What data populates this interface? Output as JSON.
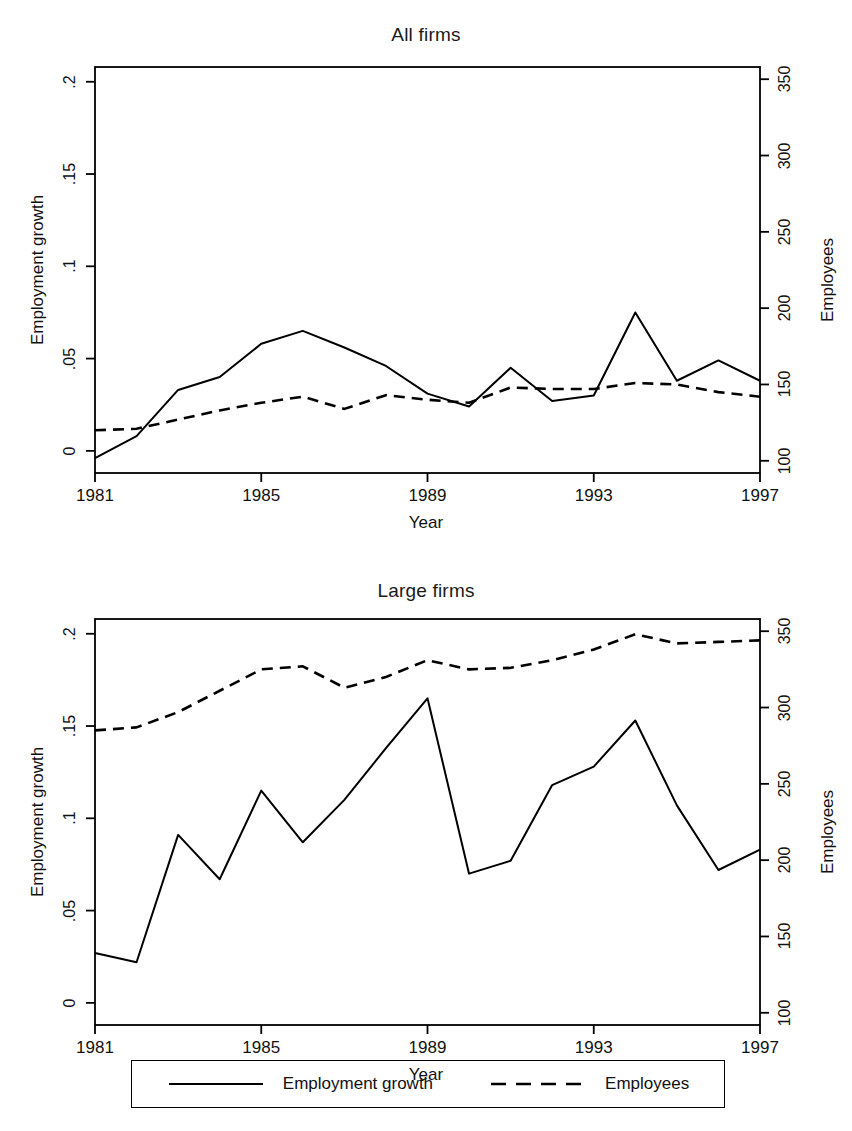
{
  "figure": {
    "background": "#ffffff",
    "ink_color": "#000000"
  },
  "legend": {
    "entries": [
      {
        "label": "Employment growth",
        "style": "solid",
        "swatch": "solid-line-swatch"
      },
      {
        "label": "Employees",
        "style": "dashed",
        "swatch": "dashed-line-swatch"
      }
    ]
  },
  "panels": [
    {
      "id": "all-firms",
      "title": "All firms",
      "xlabel": "Year",
      "ylabel_left": "Employment growth",
      "ylabel_right": "Employees",
      "xticks": [
        "1981",
        "1985",
        "1989",
        "1993",
        "1997"
      ],
      "yticks_left": [
        ".2",
        ".15",
        ".1",
        ".05",
        "0"
      ],
      "yticks_right": [
        "350",
        "300",
        "250",
        "200",
        "150",
        "100"
      ]
    },
    {
      "id": "large-firms",
      "title": "Large firms",
      "xlabel": "Year",
      "ylabel_left": "Employment growth",
      "ylabel_right": "Employees",
      "xticks": [
        "1981",
        "1985",
        "1989",
        "1993",
        "1997"
      ],
      "yticks_left": [
        ".2",
        ".15",
        ".1",
        ".05",
        "0"
      ],
      "yticks_right": [
        "350",
        "300",
        "250",
        "200",
        "150",
        "100"
      ]
    }
  ],
  "chart_data": [
    {
      "type": "line",
      "title": "All firms",
      "xlabel": "Year",
      "ylabel": "Employment growth",
      "ylabel_secondary": "Employees",
      "x": [
        1981,
        1982,
        1983,
        1984,
        1985,
        1986,
        1987,
        1988,
        1989,
        1990,
        1991,
        1992,
        1993,
        1994,
        1995,
        1996,
        1997
      ],
      "xlim": [
        1981,
        1997
      ],
      "ylim": [
        -0.012,
        0.208
      ],
      "ylim_secondary": [
        92,
        358
      ],
      "grid": false,
      "legend_position": "below-figure",
      "series": [
        {
          "name": "Employment growth",
          "style": "solid",
          "axis": "left",
          "values": [
            -0.004,
            0.008,
            0.033,
            0.04,
            0.058,
            0.065,
            0.056,
            0.046,
            0.031,
            0.024,
            0.045,
            0.027,
            0.03,
            0.075,
            0.038,
            0.049,
            0.038
          ]
        },
        {
          "name": "Employees",
          "style": "dashed",
          "axis": "right",
          "values": [
            120,
            121,
            127,
            133,
            138,
            142,
            134,
            143,
            140,
            138,
            148,
            147,
            147,
            151,
            150,
            145,
            142
          ]
        }
      ]
    },
    {
      "type": "line",
      "title": "Large firms",
      "xlabel": "Year",
      "ylabel": "Employment growth",
      "ylabel_secondary": "Employees",
      "x": [
        1981,
        1982,
        1983,
        1984,
        1985,
        1986,
        1987,
        1988,
        1989,
        1990,
        1991,
        1992,
        1993,
        1994,
        1995,
        1996,
        1997
      ],
      "xlim": [
        1981,
        1997
      ],
      "ylim": [
        -0.012,
        0.208
      ],
      "ylim_secondary": [
        92,
        358
      ],
      "grid": false,
      "legend_position": "below-figure",
      "series": [
        {
          "name": "Employment growth",
          "style": "solid",
          "axis": "left",
          "values": [
            0.027,
            0.022,
            0.091,
            0.067,
            0.115,
            0.087,
            0.11,
            0.138,
            0.165,
            0.07,
            0.077,
            0.118,
            0.128,
            0.153,
            0.107,
            0.072,
            0.083
          ]
        },
        {
          "name": "Employees",
          "style": "dashed",
          "axis": "right",
          "values": [
            285,
            287,
            297,
            311,
            325,
            327,
            313,
            320,
            331,
            325,
            326,
            331,
            338,
            348,
            342,
            343,
            344
          ]
        }
      ]
    }
  ]
}
